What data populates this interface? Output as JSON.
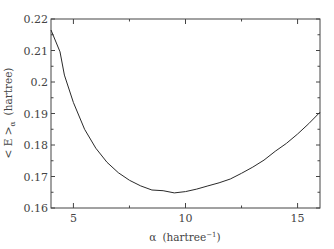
{
  "chart_data": {
    "type": "line",
    "title": "",
    "xlabel": "α (hartree⁻¹)",
    "ylabel": "< E >α (hartree)",
    "xlim": [
      4,
      16
    ],
    "ylim": [
      0.16,
      0.22
    ],
    "grid": false,
    "legend": null,
    "x_ticks": [
      5,
      10,
      15
    ],
    "x_tick_labels": [
      "5",
      "10",
      "15"
    ],
    "y_ticks": [
      0.16,
      0.17,
      0.18,
      0.19,
      0.2,
      0.21,
      0.22
    ],
    "y_tick_labels": [
      "0.16",
      "0.17",
      "0.18",
      "0.19",
      "0.2",
      "0.21",
      "0.22"
    ],
    "series": [
      {
        "name": "<E>α",
        "x": [
          4.0,
          4.4,
          4.6,
          5.0,
          5.5,
          6.0,
          6.5,
          7.0,
          7.5,
          8.0,
          8.5,
          9.0,
          9.5,
          10.0,
          10.5,
          11.0,
          11.5,
          12.0,
          12.5,
          13.0,
          13.5,
          14.0,
          14.5,
          15.0,
          15.5,
          16.0
        ],
        "y": [
          0.2165,
          0.2096,
          0.2022,
          0.1935,
          0.185,
          0.179,
          0.1745,
          0.1712,
          0.1688,
          0.167,
          0.1657,
          0.1655,
          0.1648,
          0.1652,
          0.166,
          0.167,
          0.168,
          0.1692,
          0.171,
          0.173,
          0.1752,
          0.178,
          0.1805,
          0.1835,
          0.1868,
          0.1904
        ]
      }
    ]
  },
  "labels": {
    "xlabel_alpha": "α",
    "xlabel_unit": "(hartree",
    "xlabel_sup": "−1",
    "xlabel_close": ")",
    "ylabel_main": "< E >",
    "ylabel_sub": "α",
    "ylabel_unit": "(hartree)"
  }
}
